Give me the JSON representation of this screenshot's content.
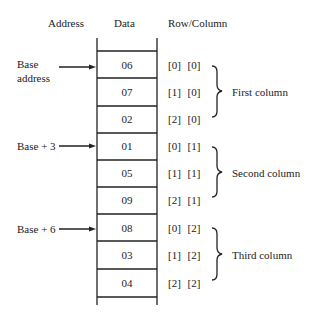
{
  "headers": {
    "address": "Address",
    "data": "Data",
    "row_column": "Row/Column"
  },
  "cells": [
    {
      "value": "06",
      "index": "[0]  [0]"
    },
    {
      "value": "07",
      "index": "[1]  [0]"
    },
    {
      "value": "02",
      "index": "[2]  [0]"
    },
    {
      "value": "01",
      "index": "[0]  [1]"
    },
    {
      "value": "05",
      "index": "[1]  [1]"
    },
    {
      "value": "09",
      "index": "[2]  [1]"
    },
    {
      "value": "08",
      "index": "[0]  [2]"
    },
    {
      "value": "03",
      "index": "[1]  [2]"
    },
    {
      "value": "04",
      "index": "[2]  [2]"
    }
  ],
  "address_labels": {
    "base_line1": "Base",
    "base_line2": "address",
    "base_plus_3": "Base + 3",
    "base_plus_6": "Base + 6"
  },
  "groups": {
    "first": "First column",
    "second": "Second column",
    "third": "Third column"
  },
  "colors": {
    "line": "#222222",
    "background": "#ffffff"
  }
}
